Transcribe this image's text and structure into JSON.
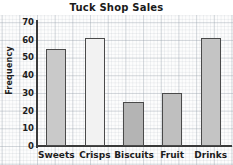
{
  "chart_data": {
    "type": "bar",
    "title": "Tuck Shop Sales",
    "xlabel": "",
    "ylabel": "Frequency",
    "categories": [
      "Sweets",
      "Crisps",
      "Biscuits",
      "Fruit",
      "Drinks"
    ],
    "values": [
      55,
      61,
      25,
      30,
      61
    ],
    "ylim": [
      0,
      70
    ],
    "ytick_labels": [
      "0",
      "10",
      "20",
      "30",
      "40",
      "50",
      "60",
      "70"
    ],
    "ytick_values": [
      0,
      10,
      20,
      30,
      40,
      50,
      60,
      70
    ],
    "grid": true,
    "legend": false,
    "bar_colors": [
      "#c9c9c9",
      "#f2f2f2",
      "#b4b4b4",
      "#bfbfbf",
      "#c4c4c4"
    ],
    "bar_edge_color": "#4a4a4a",
    "axis_color": "#3a3a3a",
    "grid_color": "#96a0aa",
    "background_color": "#fdfdfd",
    "text_color": "#1d1d1d"
  }
}
